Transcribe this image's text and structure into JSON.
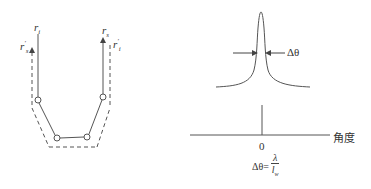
{
  "left_diagram": {
    "labels": {
      "r_i": {
        "base": "r",
        "sub": "i",
        "prime": ""
      },
      "r_s_prime": {
        "base": "r",
        "sub": "s",
        "prime": "'"
      },
      "r_s": {
        "base": "r",
        "sub": "s",
        "prime": ""
      },
      "r_i_prime": {
        "base": "r",
        "sub": "i",
        "prime": "'"
      }
    },
    "nodes": [
      {
        "x": 38,
        "y": 100
      },
      {
        "x": 57,
        "y": 138
      },
      {
        "x": 87,
        "y": 137
      },
      {
        "x": 103,
        "y": 97
      }
    ]
  },
  "right_diagram": {
    "peak_width_label": "Δθ",
    "x_axis_label": "角度",
    "origin_label": "0",
    "formula": {
      "lhs": "Δθ=",
      "numerator": "λ",
      "denominator_base": "l",
      "denominator_sub": "w"
    }
  },
  "colors": {
    "line": "#555555",
    "text": "#333333",
    "background": "#ffffff"
  }
}
